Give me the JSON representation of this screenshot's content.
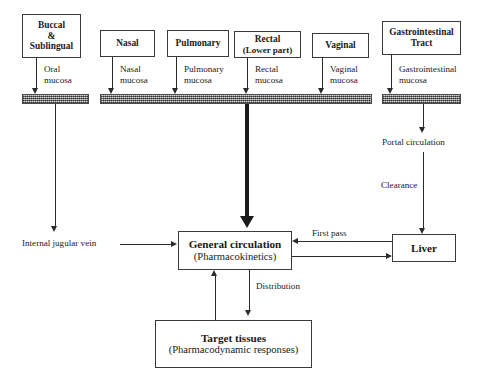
{
  "diagram": {
    "routes": [
      {
        "id": "buccal",
        "line1": "Buccal",
        "line2": "&",
        "line3": "Sublingual",
        "mucosa_line1": "Oral",
        "mucosa_line2": "mucosa"
      },
      {
        "id": "nasal",
        "line1": "Nasal",
        "mucosa_line1": "Nasal",
        "mucosa_line2": "mucosa"
      },
      {
        "id": "pulmonary",
        "line1": "Pulmonary",
        "mucosa_line1": "Pulmonary",
        "mucosa_line2": "mucosa"
      },
      {
        "id": "rectal",
        "line1": "Rectal",
        "line2": "(Lower part)",
        "mucosa_line1": "Rectal",
        "mucosa_line2": "mucosa"
      },
      {
        "id": "vaginal",
        "line1": "Vaginal",
        "mucosa_line1": "Vaginal",
        "mucosa_line2": "mucosa"
      },
      {
        "id": "git",
        "line1": "Gastrointestinal",
        "line2": "Tract",
        "mucosa_line1": "Gastrointestinal",
        "mucosa_line2": "mucosa"
      }
    ],
    "nodes": {
      "general_circulation": {
        "title": "General circulation",
        "subtitle": "(Pharmacokinetics)"
      },
      "liver": {
        "title": "Liver"
      },
      "target_tissues": {
        "title": "Target tissues",
        "subtitle": "(Pharmacodynamic responses)"
      }
    },
    "edge_labels": {
      "internal_jugular_vein": "Internal jugular vein",
      "portal_circulation": "Portal circulation",
      "clearance": "Clearance",
      "first_pass": "First pass",
      "distribution": "Distribution"
    },
    "colors": {
      "mucosa_bar": "#8d8d8d",
      "line": "#2b2b2b",
      "box_border": "#3a3a3a",
      "background": "#ffffff"
    }
  }
}
